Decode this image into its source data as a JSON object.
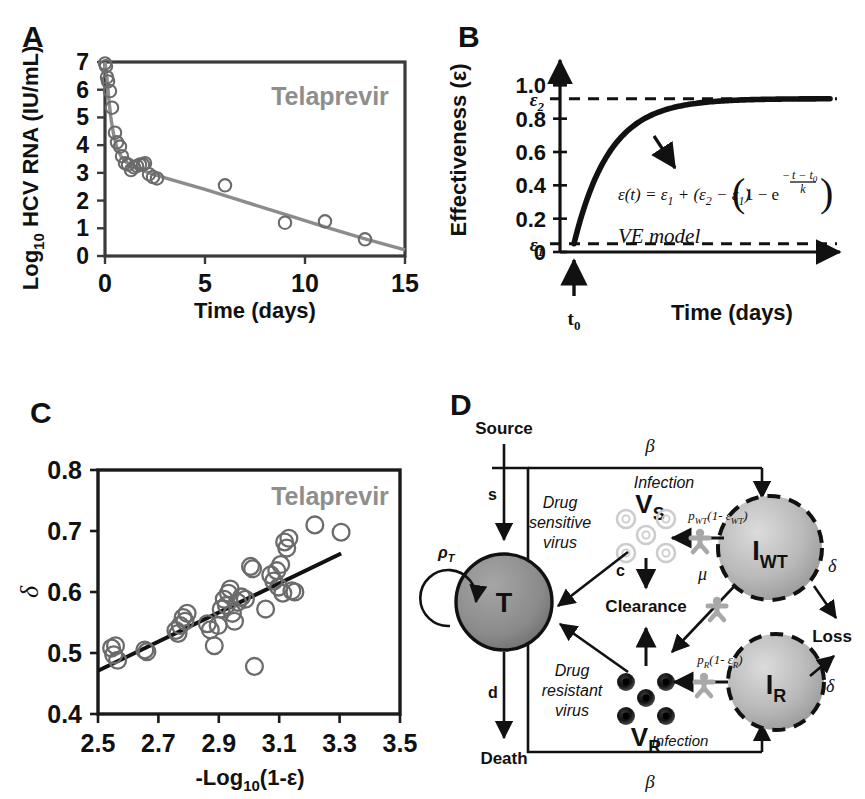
{
  "figure": {
    "panels": [
      "A",
      "B",
      "C",
      "D"
    ]
  },
  "panelA": {
    "label": "A",
    "annotation": "Telaprevir",
    "ylabel": "Log",
    "ylabel_sub": "10",
    "ylabel_rest": " HCV RNA (IU/mL)",
    "xlabel": "Time (days)",
    "chart_data": {
      "type": "scatter",
      "title": "Telaprevir",
      "xlabel": "Time (days)",
      "ylabel": "Log10 HCV RNA (IU/mL)",
      "xlim": [
        0,
        15
      ],
      "ylim": [
        0,
        7
      ],
      "xticks": [
        0,
        5,
        10,
        15
      ],
      "yticks": [
        0,
        1,
        2,
        3,
        4,
        5,
        6,
        7
      ],
      "grid": false,
      "series": [
        {
          "name": "observed HCV RNA",
          "marker": "open-circle",
          "color": "#6b6b6b",
          "points": [
            [
              0.0,
              6.95
            ],
            [
              0.05,
              6.85
            ],
            [
              0.1,
              6.45
            ],
            [
              0.15,
              6.3
            ],
            [
              0.25,
              5.95
            ],
            [
              0.35,
              5.35
            ],
            [
              0.5,
              4.45
            ],
            [
              0.6,
              4.1
            ],
            [
              0.75,
              3.95
            ],
            [
              0.85,
              3.6
            ],
            [
              1.0,
              3.35
            ],
            [
              1.15,
              3.3
            ],
            [
              1.3,
              3.1
            ],
            [
              1.45,
              3.2
            ],
            [
              1.6,
              3.25
            ],
            [
              1.75,
              3.3
            ],
            [
              1.9,
              3.3
            ],
            [
              2.0,
              3.35
            ],
            [
              2.2,
              2.95
            ],
            [
              2.4,
              2.85
            ],
            [
              2.6,
              2.8
            ],
            [
              6.0,
              2.55
            ],
            [
              9.0,
              1.2
            ],
            [
              11.0,
              1.25
            ],
            [
              13.0,
              0.6
            ]
          ]
        },
        {
          "name": "biphasic model fit",
          "marker": "line",
          "color": "#8c8c8c",
          "points": [
            [
              0.0,
              7.0
            ],
            [
              0.1,
              6.4
            ],
            [
              0.2,
              5.6
            ],
            [
              0.3,
              4.95
            ],
            [
              0.45,
              4.3
            ],
            [
              0.6,
              3.9
            ],
            [
              0.8,
              3.6
            ],
            [
              1.0,
              3.42
            ],
            [
              1.3,
              3.28
            ],
            [
              1.7,
              3.15
            ],
            [
              2.2,
              3.0
            ],
            [
              3.0,
              2.82
            ],
            [
              5.0,
              2.4
            ],
            [
              7.0,
              1.95
            ],
            [
              9.0,
              1.5
            ],
            [
              11.0,
              1.05
            ],
            [
              13.0,
              0.62
            ],
            [
              15.0,
              0.22
            ]
          ]
        }
      ]
    }
  },
  "panelB": {
    "label": "B",
    "ylabel": "Effectiveness (ε)",
    "xlabel": "Time (days)",
    "model_name": "VE model",
    "eps1_label": "ε",
    "eps1_sub": "1",
    "eps2_label": "ε",
    "eps2_sub": "2",
    "t0_label": "t",
    "t0_sub": "0",
    "equation": {
      "lhs": "ε(t) = ε",
      "lhs_sub": "1",
      "mid": " + (ε",
      "mid_sub1": "2",
      "mid2": " − ε",
      "mid_sub2": "1",
      "mid3": ")",
      "bracket_open": "(",
      "inner": "1 − e",
      "exp_num": "t − t",
      "exp_num_sub": "0",
      "exp_den": "k",
      "bracket_close": ")"
    },
    "chart_data": {
      "type": "line",
      "title": "VE model",
      "xlabel": "Time (days)",
      "ylabel": "Effectiveness (ε)",
      "ylim": [
        0,
        1.08
      ],
      "yticks": [
        0,
        0.2,
        0.4,
        0.6,
        0.8,
        1.0
      ],
      "ytick_labels": [
        "0",
        "0.2",
        "0.4",
        "0.6",
        "0.8",
        "1.0"
      ],
      "grid": false,
      "eps1_value": 0.05,
      "eps2_value": 0.92,
      "t0_value": 0.0,
      "k_value": 1.25,
      "annotations": [
        "ε2 asymptote (dashed)",
        "ε1 baseline (dashed)",
        "t0 onset arrow",
        "arrow pointing to curve"
      ]
    }
  },
  "panelC": {
    "label": "C",
    "annotation": "Telaprevir",
    "ylabel": "δ",
    "xlabel_pre": "-Log",
    "xlabel_sub": "10",
    "xlabel_post": "(1-ε)",
    "chart_data": {
      "type": "scatter",
      "title": "Telaprevir",
      "xlabel": "-Log10(1-ε)",
      "ylabel": "δ",
      "xlim": [
        2.5,
        3.5
      ],
      "ylim": [
        0.4,
        0.8
      ],
      "xticks": [
        2.5,
        2.7,
        2.9,
        3.1,
        3.3,
        3.5
      ],
      "yticks": [
        0.4,
        0.5,
        0.6,
        0.7,
        0.8
      ],
      "grid": false,
      "series": [
        {
          "name": "patient estimates",
          "marker": "open-circle",
          "color": "#6b6b6b",
          "points": [
            [
              2.545,
              0.508
            ],
            [
              2.552,
              0.497
            ],
            [
              2.558,
              0.512
            ],
            [
              2.565,
              0.488
            ],
            [
              2.655,
              0.505
            ],
            [
              2.662,
              0.502
            ],
            [
              2.758,
              0.537
            ],
            [
              2.765,
              0.532
            ],
            [
              2.772,
              0.545
            ],
            [
              2.782,
              0.558
            ],
            [
              2.788,
              0.552
            ],
            [
              2.795,
              0.565
            ],
            [
              2.862,
              0.548
            ],
            [
              2.872,
              0.538
            ],
            [
              2.885,
              0.512
            ],
            [
              2.898,
              0.545
            ],
            [
              2.908,
              0.572
            ],
            [
              2.918,
              0.588
            ],
            [
              2.925,
              0.578
            ],
            [
              2.932,
              0.598
            ],
            [
              2.938,
              0.605
            ],
            [
              2.945,
              0.565
            ],
            [
              2.952,
              0.552
            ],
            [
              2.962,
              0.583
            ],
            [
              2.975,
              0.592
            ],
            [
              2.988,
              0.588
            ],
            [
              3.005,
              0.642
            ],
            [
              3.012,
              0.638
            ],
            [
              3.018,
              0.478
            ],
            [
              3.055,
              0.572
            ],
            [
              3.072,
              0.628
            ],
            [
              3.082,
              0.618
            ],
            [
              3.092,
              0.635
            ],
            [
              3.098,
              0.608
            ],
            [
              3.105,
              0.645
            ],
            [
              3.112,
              0.598
            ],
            [
              3.118,
              0.682
            ],
            [
              3.125,
              0.672
            ],
            [
              3.132,
              0.688
            ],
            [
              3.142,
              0.602
            ],
            [
              3.152,
              0.6
            ],
            [
              3.218,
              0.71
            ],
            [
              3.305,
              0.698
            ]
          ]
        },
        {
          "name": "linear regression",
          "marker": "line",
          "color": "#111111",
          "points": [
            [
              2.5,
              0.471
            ],
            [
              3.305,
              0.663
            ]
          ]
        }
      ]
    }
  },
  "panelD": {
    "label": "D",
    "nodes": {
      "target": "T",
      "infected_wt": "I",
      "infected_wt_sub": "WT",
      "infected_r": "I",
      "infected_r_sub": "R",
      "virus_s": "V",
      "virus_s_sub": "S",
      "virus_r": "V",
      "virus_r_sub": "R"
    },
    "labels": {
      "source": "Source",
      "death": "Death",
      "clearance": "Clearance",
      "loss": "Loss",
      "drug_sensitive": "Drug\nsensitive\nvirus",
      "drug_sensitive_l1": "Drug",
      "drug_sensitive_l2": "sensitive",
      "drug_sensitive_l3": "virus",
      "drug_resistant_l1": "Drug",
      "drug_resistant_l2": "resistant",
      "drug_resistant_l3": "virus",
      "infection_top": "Infection",
      "infection_bottom": "Infection"
    },
    "rates": {
      "s": "s",
      "d": "d",
      "c": "c",
      "mu": "μ",
      "rho_T": "ρ",
      "rho_T_sub": "T",
      "beta_top": "β",
      "beta_bottom": "β",
      "delta_top": "δ",
      "delta_bottom": "δ",
      "p_wt": "p",
      "p_wt_sub": "WT",
      "p_wt_rest": "(1- ε",
      "p_wt_rest_sub": "WT",
      "p_wt_close": ")",
      "p_r": "p",
      "p_r_sub": "R",
      "p_r_rest": "(1- ε",
      "p_r_rest_sub": "R",
      "p_r_close": ")"
    },
    "colors": {
      "target_fill": "#8a8a8a",
      "infected_fill": "#b4b4b4",
      "virus_resistant": "#1a1a1a",
      "virus_sensitive": "#cccccc",
      "cross_marker": "#a8a8a8",
      "stroke": "#111111"
    }
  }
}
